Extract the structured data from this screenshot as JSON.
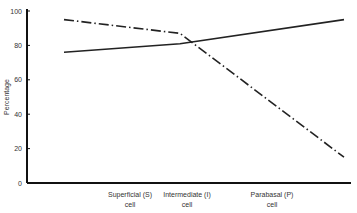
{
  "chart_data": {
    "type": "line",
    "title": "",
    "xlabel": "",
    "ylabel": "Percentage",
    "ylim": [
      0,
      100
    ],
    "yticks": [
      0,
      20,
      40,
      60,
      80,
      100
    ],
    "grid": false,
    "legend": "none",
    "categories": [
      {
        "line1": "Superficial (S)",
        "line2": "cell"
      },
      {
        "line1": "Intermediate (I)",
        "line2": "cell"
      },
      {
        "line1": "Parabasal (P)",
        "line2": "cell"
      }
    ],
    "series": [
      {
        "name": "solid",
        "style": "solid",
        "color": "#222222",
        "values": [
          76,
          81,
          95
        ]
      },
      {
        "name": "dash-dot",
        "style": "dash-dot",
        "color": "#222222",
        "values": [
          95,
          87,
          15
        ]
      }
    ]
  }
}
